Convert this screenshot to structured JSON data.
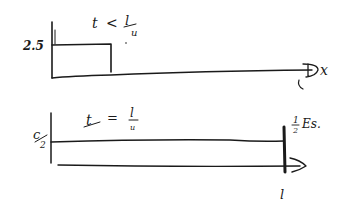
{
  "diagram": {
    "title": "",
    "ink_color": "#1a1a1a",
    "background": "#ffffff",
    "panels": [
      {
        "id": "top",
        "y_label": "2.5",
        "annotation": {
          "lhs": "t",
          "relation": "<",
          "rhs_num": "l",
          "rhs_den": "u"
        },
        "axis_end_label": "x",
        "axis_mark_label": "l",
        "shape": "rectangular pulse"
      },
      {
        "id": "bottom",
        "y_label_num": "c",
        "y_label_den": "2",
        "annotation": {
          "lhs": "t",
          "relation": "=",
          "rhs_num": "l",
          "rhs_den": "u"
        },
        "end_note_num": "1",
        "end_note_den": "2",
        "end_note_text": "Es.",
        "axis_mark_label": "l",
        "shape": "flat level up to l"
      }
    ]
  }
}
